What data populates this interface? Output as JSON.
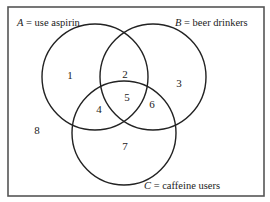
{
  "diagram": {
    "type": "venn",
    "sets": [
      {
        "id": "A",
        "letter": "A",
        "desc": " = use aspirin",
        "cx": 95,
        "cy": 77,
        "r": 53
      },
      {
        "id": "B",
        "letter": "B",
        "desc": " = beer drinkers",
        "cx": 153,
        "cy": 77,
        "r": 53
      },
      {
        "id": "C",
        "letter": "C",
        "desc": " = caffeine users",
        "cx": 124,
        "cy": 133,
        "r": 52
      }
    ],
    "regions": [
      {
        "number": "1",
        "x": 70,
        "y": 79,
        "membership": "A only"
      },
      {
        "number": "2",
        "x": 125,
        "y": 78,
        "membership": "A and B only"
      },
      {
        "number": "3",
        "x": 179,
        "y": 87,
        "membership": "B only"
      },
      {
        "number": "4",
        "x": 99,
        "y": 113,
        "membership": "A and C only"
      },
      {
        "number": "5",
        "x": 127,
        "y": 102,
        "membership": "A, B and C"
      },
      {
        "number": "6",
        "x": 152,
        "y": 108,
        "membership": "B and C only"
      },
      {
        "number": "7",
        "x": 125,
        "y": 150,
        "membership": "C only"
      },
      {
        "number": "8",
        "x": 37,
        "y": 134,
        "membership": "none"
      }
    ],
    "frame": {
      "x": 8,
      "y": 7,
      "width": 256,
      "height": 189
    }
  }
}
